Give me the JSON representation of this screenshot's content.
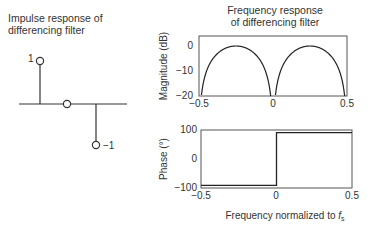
{
  "impulse": {
    "title_line1": "Impulse response of",
    "title_line2": "differencing filter",
    "stems": [
      {
        "n": 0,
        "value": 1,
        "label": "1"
      },
      {
        "n": 1,
        "value": 0,
        "label": ""
      },
      {
        "n": 2,
        "value": -1,
        "label": "−1"
      }
    ]
  },
  "freq": {
    "title_line1": "Frequency response",
    "title_line2": "of differencing filter",
    "xlabel": "Frequency normalized to ",
    "xlabel_italic": "f",
    "xlabel_sub": "s"
  },
  "chart_data": [
    {
      "type": "line",
      "title": "Impulse response of differencing filter",
      "x": [
        0,
        1,
        2
      ],
      "values": [
        1,
        0,
        -1
      ],
      "style": "stem",
      "annotations": [
        "1",
        "−1"
      ]
    },
    {
      "type": "line",
      "title": "Frequency response of differencing filter (magnitude)",
      "xlabel": "",
      "ylabel": "Magnitude (dB)",
      "xlim": [
        -0.5,
        0.5
      ],
      "ylim": [
        -20,
        4
      ],
      "xticks": [
        "−0.5",
        "0",
        "0.5"
      ],
      "yticks": [
        "0",
        "−10",
        "−20"
      ],
      "x": [
        -0.5,
        -0.45,
        -0.4,
        -0.35,
        -0.3,
        -0.25,
        -0.2,
        -0.15,
        -0.1,
        -0.05,
        0,
        0.05,
        0.1,
        0.15,
        0.2,
        0.25,
        0.3,
        0.35,
        0.4,
        0.45,
        0.5
      ],
      "values": [
        -20,
        -10.2,
        -4.4,
        -1.8,
        -0.4,
        0,
        -0.4,
        -1.8,
        -4.4,
        -10.2,
        -20,
        -10.2,
        -4.4,
        -1.8,
        -0.4,
        0,
        -0.4,
        -1.8,
        -4.4,
        -10.2,
        -20
      ]
    },
    {
      "type": "line",
      "title": "Frequency response of differencing filter (phase)",
      "xlabel": "Frequency normalized to fs",
      "ylabel": "Phase (°)",
      "xlim": [
        -0.5,
        0.5
      ],
      "ylim": [
        -100,
        100
      ],
      "xticks": [
        "−0.5",
        "0",
        "0.5"
      ],
      "yticks": [
        "100",
        "0",
        "−100"
      ],
      "x": [
        -0.5,
        0,
        0,
        0.5
      ],
      "values": [
        -90,
        -90,
        90,
        90
      ]
    }
  ],
  "axes": {
    "mag_ylabel": "Magnitude (dB)",
    "phase_ylabel": "Phase (°)",
    "mag_yticks": [
      "0",
      "−10",
      "−20"
    ],
    "phase_yticks": [
      "100",
      "0",
      "−100"
    ],
    "xticks": [
      "−0.5",
      "0",
      "0.5"
    ]
  }
}
